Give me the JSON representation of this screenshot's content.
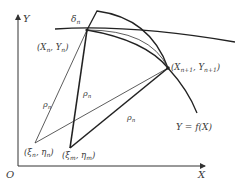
{
  "diagram": {
    "axes": {
      "y_label": "Y",
      "x_label": "X",
      "origin_label": "O"
    },
    "labels": {
      "delta": "δ",
      "delta_sub": "n",
      "point_n": "(X",
      "point_n_sub": "n",
      "point_n_mid": ", Y",
      "point_n_sub2": "n",
      "point_n_end": ")",
      "point_n1": "(X",
      "point_n1_sub": "n+1",
      "point_n1_mid": ", Y",
      "point_n1_sub2": "n+1",
      "point_n1_end": ")",
      "xi_n": "(ξ",
      "xi_n_sub": "n",
      "xi_n_mid": ", η",
      "xi_n_sub2": "n",
      "xi_n_end": ")",
      "xi_m": "(ξ",
      "xi_m_sub": "m",
      "xi_m_mid": ", η",
      "xi_m_sub2": "m",
      "xi_m_end": ")",
      "rho_1": "ρ",
      "rho_1_sub": "n",
      "rho_2": "ρ",
      "rho_2_sub": "n",
      "rho_3": "ρ",
      "rho_3_sub": "n",
      "curve_label": "Y = f(X)"
    }
  }
}
